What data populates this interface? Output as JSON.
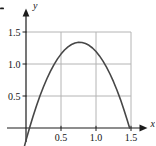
{
  "figure": {
    "background": "#ffffff",
    "axis_color": "#1c1c1c",
    "grid_color": "#b4b4b4",
    "curve_color": "#474747",
    "label_color": "#141414",
    "y_axis_letter": "y",
    "x_axis_letter": "x"
  },
  "chart_data": {
    "type": "line",
    "title": "",
    "xlabel": "x",
    "ylabel": "y",
    "grid": true,
    "legend": "none",
    "xlim": [
      -0.27,
      1.84
    ],
    "ylim": [
      -0.28,
      1.84
    ],
    "x_ticks": [
      0.5,
      1.0,
      1.5
    ],
    "x_tick_labels": [
      "0.5",
      "1.0",
      "1.5"
    ],
    "y_ticks": [
      0.5,
      1.0,
      1.5
    ],
    "y_tick_labels": [
      "0.5",
      "1.0",
      "1.5"
    ],
    "series": [
      {
        "name": "curve",
        "description": "Downward-opening parabola; x-intercepts at about 0.05 and 1.48; maximum about 1.34 at x about 0.77; dips below the x-axis just left of the origin.",
        "x": [
          -0.02,
          0,
          0.05,
          0.1,
          0.15,
          0.2,
          0.25,
          0.3,
          0.35,
          0.4,
          0.45,
          0.5,
          0.55,
          0.6,
          0.65,
          0.7,
          0.75,
          0.8,
          0.85,
          0.9,
          0.95,
          1.0,
          1.05,
          1.1,
          1.15,
          1.2,
          1.25,
          1.3,
          1.35,
          1.4,
          1.45,
          1.48
        ],
        "y": [
          -0.275,
          -0.194,
          0.0,
          0.181,
          0.348,
          0.503,
          0.645,
          0.773,
          0.888,
          0.99,
          1.079,
          1.155,
          1.218,
          1.268,
          1.305,
          1.328,
          1.339,
          1.336,
          1.32,
          1.292,
          1.25,
          1.195,
          1.127,
          1.045,
          0.951,
          0.844,
          0.723,
          0.59,
          0.443,
          0.283,
          0.11,
          0.0
        ]
      }
    ]
  }
}
